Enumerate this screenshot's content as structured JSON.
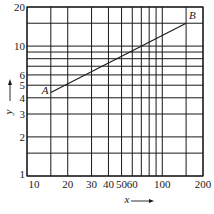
{
  "chart_data": {
    "type": "line",
    "title": "",
    "xlabel": "x",
    "ylabel": "y",
    "xscale": "log",
    "yscale": "log",
    "xlim": [
      10,
      200
    ],
    "ylim": [
      1,
      20
    ],
    "grid": true,
    "x_ticks": [
      "10",
      "20",
      "30",
      "40",
      "50",
      "60",
      "100",
      "200"
    ],
    "y_ticks": [
      "1",
      "2",
      "3",
      "4",
      "5",
      "6",
      "10",
      "20"
    ],
    "x_gridlines": [
      10,
      15,
      20,
      30,
      40,
      50,
      60,
      70,
      80,
      90,
      100,
      150,
      200
    ],
    "y_gridlines": [
      1,
      1.5,
      2,
      3,
      4,
      5,
      6,
      7,
      8,
      9,
      10,
      15,
      20
    ],
    "series": [
      {
        "name": "AB",
        "points": [
          {
            "label": "A",
            "x": 15,
            "y": 4.4
          },
          {
            "label": "B",
            "x": 150,
            "y": 15
          }
        ]
      }
    ],
    "annotations": [
      "A",
      "B"
    ]
  },
  "colors": {
    "grid": "#1a1a1a",
    "line": "#1a1a1a",
    "background": "#ffffff"
  }
}
